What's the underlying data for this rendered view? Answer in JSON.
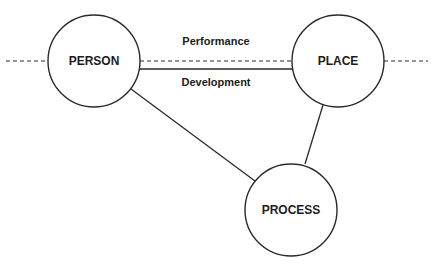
{
  "diagram": {
    "type": "relationship-triangle",
    "nodes": [
      {
        "id": "person",
        "label": "PERSON",
        "cx": 94,
        "cy": 61,
        "r": 46
      },
      {
        "id": "place",
        "label": "PLACE",
        "cx": 338,
        "cy": 61,
        "r": 46
      },
      {
        "id": "process",
        "label": "PROCESS",
        "cx": 291,
        "cy": 210,
        "r": 46
      }
    ],
    "edges": [
      {
        "from": "person",
        "to": "place",
        "style": "dashed",
        "label": "Performance",
        "label_position": "above"
      },
      {
        "from": "person",
        "to": "place",
        "style": "solid",
        "label": "Development",
        "label_position": "below"
      },
      {
        "from": "person",
        "to": "process",
        "style": "solid",
        "label": ""
      },
      {
        "from": "place",
        "to": "process",
        "style": "solid",
        "label": ""
      }
    ],
    "extensions": [
      {
        "side": "left",
        "style": "dashed"
      },
      {
        "side": "right",
        "style": "dashed"
      }
    ]
  },
  "labels": {
    "person": "PERSON",
    "place": "PLACE",
    "process": "PROCESS",
    "performance": "Performance",
    "development": "Development"
  },
  "colors": {
    "stroke": "#2a2a2a",
    "text": "#1c1c1c",
    "background": "#ffffff"
  }
}
